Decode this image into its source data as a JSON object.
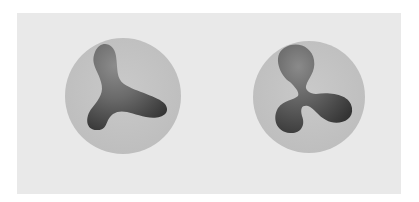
{
  "figure": {
    "panel_color": "#e9e9e9",
    "circle_color": "#c6c6c6",
    "shape_color_dark": "#3a3a3a",
    "shape_color_light": "#8a8a8a",
    "items": [
      {
        "label": "three-lobed-smooth-shape",
        "cx": 123,
        "cy": 96,
        "r": 58
      },
      {
        "label": "three-lobed-bulb-shape",
        "cx": 309,
        "cy": 97,
        "r": 56
      }
    ]
  }
}
